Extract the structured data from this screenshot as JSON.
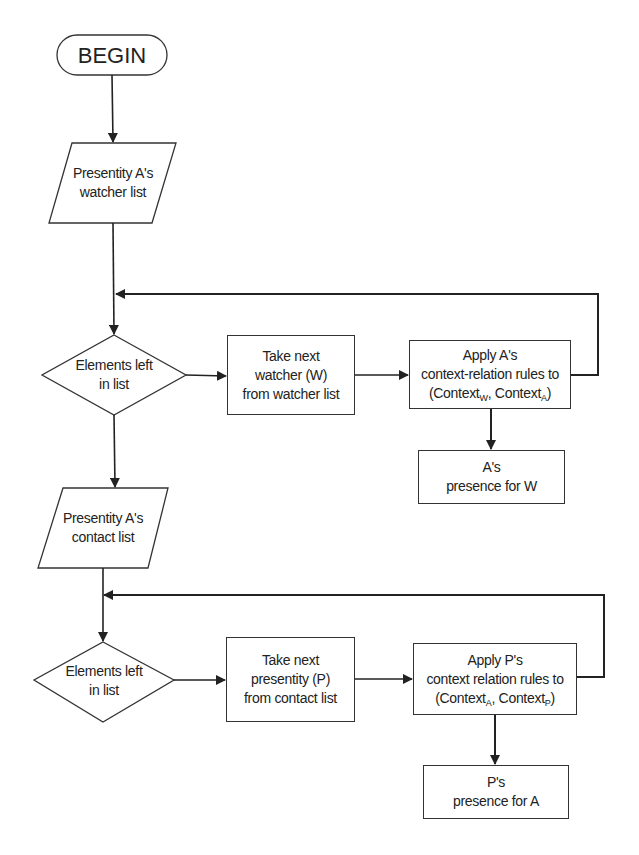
{
  "diagram": {
    "type": "flowchart",
    "start": {
      "label": "BEGIN"
    },
    "part1": {
      "input": {
        "line1": "Presentity A's",
        "line2": "watcher list"
      },
      "decision": {
        "line1": "Elements left",
        "line2": "in list"
      },
      "take_next": {
        "line1": "Take next",
        "line2": "watcher (W)",
        "line3": "from watcher list"
      },
      "apply": {
        "line1": "Apply A's",
        "line2": "context-relation rules to",
        "line3_prefix": "(Context",
        "sub1": "W",
        "line3_mid": ", Context",
        "sub2": "A",
        "line3_suffix": ")"
      },
      "output": {
        "line1": "A's",
        "line2": "presence for W"
      }
    },
    "part2": {
      "input": {
        "line1": "Presentity A's",
        "line2": "contact list"
      },
      "decision": {
        "line1": "Elements left",
        "line2": "in list"
      },
      "take_next": {
        "line1": "Take next",
        "line2": "presentity (P)",
        "line3": "from contact list"
      },
      "apply": {
        "line1": "Apply P's",
        "line2": "context relation rules to",
        "line3_prefix": "(Context",
        "sub1": "A",
        "line3_mid": ", Context",
        "sub2": "P",
        "line3_suffix": ")"
      },
      "output": {
        "line1": "P's",
        "line2": "presence for A"
      }
    },
    "colors": {
      "stroke": "#333333",
      "background": "#ffffff",
      "text": "#222222"
    }
  }
}
